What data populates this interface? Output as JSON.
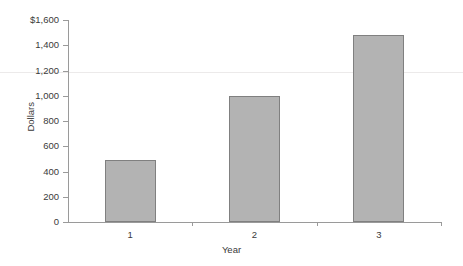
{
  "chart_data": {
    "type": "bar",
    "title": "",
    "xlabel": "Year",
    "ylabel": "Dollars",
    "categories": [
      "1",
      "2",
      "3"
    ],
    "values": [
      490,
      1000,
      1480
    ],
    "ylim": [
      0,
      1600
    ],
    "yticks": [
      0,
      200,
      400,
      600,
      800,
      1000,
      1200,
      1400,
      1600
    ],
    "ytick_labels": [
      "0",
      "200",
      "400",
      "600",
      "800",
      "1,000",
      "1,200",
      "1,400",
      "$1,600"
    ],
    "grid": false,
    "legend": null,
    "series": [
      {
        "name": "Dollars",
        "values": [
          490,
          1000,
          1480
        ]
      }
    ],
    "bar_fill_color": "#b3b3b3",
    "bar_border_color": "#808080",
    "axis_color": "#9a9a9a",
    "text_color": "#3a3a3a"
  }
}
